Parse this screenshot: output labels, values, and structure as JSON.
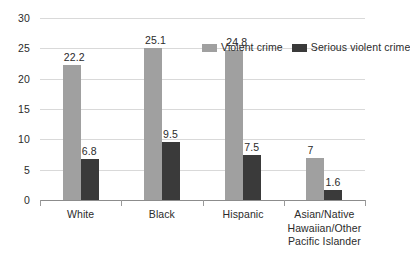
{
  "chart_data": {
    "type": "bar",
    "title": "",
    "subtitle": "",
    "xlabel": "",
    "ylabel": "",
    "ylim": [
      0,
      30
    ],
    "ytick_step": 5,
    "ytick_labels": [
      "30",
      "25",
      "20",
      "15",
      "10",
      "5",
      "0"
    ],
    "grid": true,
    "legend_position": "top-right inside plot",
    "categories": [
      "White",
      "Black",
      "Hispanic",
      "Asian/Native Hawaiian/Other Pacific Islander"
    ],
    "category_label_lines": [
      [
        "White"
      ],
      [
        "Black"
      ],
      [
        "Hispanic"
      ],
      [
        "Asian/Native",
        "Hawaiian/Other",
        "Pacific Islander"
      ]
    ],
    "series": [
      {
        "name": "Violent crime",
        "color": "#a0a0a0",
        "values": [
          22.2,
          25.1,
          24.8,
          7
        ],
        "labels": [
          "22.2",
          "25.1",
          "24.8",
          "7"
        ]
      },
      {
        "name": "Serious violent crime",
        "color": "#3a3a3a",
        "values": [
          6.8,
          9.5,
          7.5,
          1.6
        ],
        "labels": [
          "6.8",
          "9.5",
          "7.5",
          "1.6"
        ]
      }
    ]
  },
  "colors": {
    "violent_crime": "#a0a0a0",
    "serious_violent_crime": "#3a3a3a",
    "gridline": "#d9d9d9",
    "axis": "#8c8c8c",
    "text": "#2b2b2b",
    "background": "#ffffff"
  }
}
